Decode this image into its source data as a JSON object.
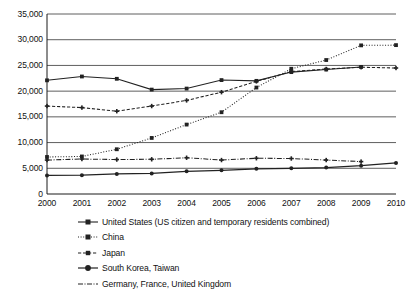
{
  "chart_data": {
    "type": "line",
    "title": "",
    "subtitle": "",
    "xlabel": "",
    "ylabel": "",
    "categories": [
      "2000",
      "2001",
      "2002",
      "2003",
      "2004",
      "2005",
      "2006",
      "2007",
      "2008",
      "2009",
      "2010"
    ],
    "x": [
      2000,
      2001,
      2002,
      2003,
      2004,
      2005,
      2006,
      2007,
      2008,
      2009,
      2010
    ],
    "xlim": [
      2000,
      2010
    ],
    "ylim": [
      0,
      35000
    ],
    "ytick_labels": [
      "0",
      "5,000",
      "10,000",
      "15,000",
      "20,000",
      "25,000",
      "30,000",
      "35,000"
    ],
    "ytick_values": [
      0,
      5000,
      10000,
      15000,
      20000,
      25000,
      30000,
      35000
    ],
    "grid": "horizontal",
    "legend_position": "bottom-left",
    "series": [
      {
        "name": "United States (US citizen and temporary residents combined)",
        "style": "solid",
        "marker": "square",
        "color": "#222222",
        "values": [
          22100,
          22850,
          22400,
          20300,
          20500,
          22150,
          22000,
          23700,
          24200,
          24700,
          null
        ]
      },
      {
        "name": "China",
        "style": "dotted",
        "marker": "square",
        "color": "#222222",
        "values": [
          7200,
          7300,
          8700,
          10900,
          13500,
          15900,
          20700,
          24350,
          26050,
          28900,
          28950
        ]
      },
      {
        "name": "Japan",
        "style": "dashed",
        "marker": "plus",
        "color": "#222222",
        "values": [
          17100,
          16800,
          16100,
          17100,
          18200,
          19800,
          21900,
          23800,
          24300,
          24650,
          24500
        ]
      },
      {
        "name": "South Korea, Taiwan",
        "style": "solid",
        "marker": "circle",
        "color": "#222222",
        "values": [
          3600,
          3650,
          3900,
          4000,
          4400,
          4600,
          4900,
          5000,
          5150,
          5500,
          6050
        ]
      },
      {
        "name": "Germany, France, United Kingdom",
        "style": "dash-dot",
        "marker": "plus",
        "color": "#222222",
        "values": [
          6600,
          6800,
          6700,
          6750,
          7050,
          6600,
          6950,
          6900,
          6600,
          6300,
          null
        ]
      }
    ]
  },
  "legend": {
    "items": [
      {
        "label": "United States (US citizen and temporary residents combined)",
        "icon": "line-solid-marker-icon"
      },
      {
        "label": "China",
        "icon": "line-dotted-marker-icon"
      },
      {
        "label": "Japan",
        "icon": "line-dashed-marker-icon"
      },
      {
        "label": "South Korea, Taiwan",
        "icon": "line-solid-dot-marker-icon"
      },
      {
        "label": "Germany, France, United Kingdom",
        "icon": "line-dashdot-marker-icon"
      }
    ]
  },
  "colors": {
    "axis": "#1a1a1a",
    "grid": "#4d4d4d",
    "series": "#222222",
    "background": "#ffffff"
  }
}
